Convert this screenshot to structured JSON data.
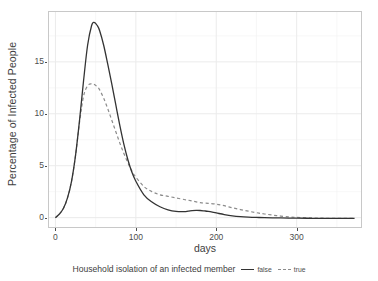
{
  "chart_data": {
    "type": "line",
    "title": "",
    "xlabel": "days",
    "ylabel": "Percentage of Infected People",
    "xlim": [
      -8,
      380
    ],
    "ylim": [
      -0.9,
      19.8
    ],
    "xticks": [
      0,
      100,
      200,
      300
    ],
    "yticks": [
      0,
      5,
      10,
      15
    ],
    "grid": true,
    "legend": {
      "position": "bottom",
      "title": "Household isolation of an infected member",
      "entries": [
        {
          "label": "false",
          "style": "solid",
          "color": "#333333"
        },
        {
          "label": "true",
          "style": "dashed",
          "color": "#8c8c8c"
        }
      ]
    },
    "x": [
      0,
      5,
      10,
      15,
      20,
      25,
      30,
      35,
      40,
      45,
      48,
      52,
      55,
      60,
      65,
      70,
      75,
      80,
      85,
      90,
      95,
      100,
      110,
      120,
      130,
      140,
      150,
      160,
      165,
      170,
      175,
      180,
      185,
      190,
      200,
      210,
      220,
      230,
      240,
      250,
      260,
      275,
      290,
      300,
      320,
      340,
      360,
      372
    ],
    "series": [
      {
        "name": "false",
        "label": "Household isolation: false",
        "style": "solid",
        "color": "#333333",
        "values": [
          0.0,
          0.35,
          0.9,
          1.9,
          3.5,
          6.0,
          9.4,
          13.2,
          16.6,
          18.5,
          18.8,
          18.5,
          18.0,
          16.6,
          14.8,
          12.9,
          10.9,
          8.9,
          7.1,
          5.6,
          4.4,
          3.5,
          2.2,
          1.5,
          1.05,
          0.75,
          0.6,
          0.58,
          0.62,
          0.67,
          0.7,
          0.69,
          0.65,
          0.6,
          0.45,
          0.3,
          0.18,
          0.1,
          0.05,
          0.02,
          0.0,
          -0.02,
          -0.04,
          -0.05,
          -0.06,
          -0.07,
          -0.07,
          -0.07
        ]
      },
      {
        "name": "true",
        "label": "Household isolation: true",
        "style": "dashed",
        "color": "#8c8c8c",
        "values": [
          0.0,
          0.35,
          0.9,
          1.9,
          3.5,
          6.0,
          9.2,
          11.7,
          12.7,
          12.9,
          12.85,
          12.6,
          12.3,
          11.5,
          10.5,
          9.4,
          8.3,
          7.2,
          6.2,
          5.3,
          4.5,
          3.9,
          3.0,
          2.5,
          2.2,
          2.05,
          1.9,
          1.75,
          1.68,
          1.6,
          1.52,
          1.45,
          1.4,
          1.38,
          1.3,
          1.15,
          0.95,
          0.78,
          0.62,
          0.48,
          0.35,
          0.2,
          0.08,
          0.03,
          -0.03,
          -0.06,
          -0.07,
          -0.07
        ]
      }
    ]
  },
  "axes": {
    "y_title": "Percentage of Infected People",
    "x_title": "days",
    "y_tick_labels": [
      "0",
      "5",
      "10",
      "15"
    ],
    "x_tick_labels": [
      "0",
      "100",
      "200",
      "300"
    ]
  },
  "legend": {
    "title": "Household isolation of an infected member",
    "item_false": "false",
    "item_true": "true"
  }
}
